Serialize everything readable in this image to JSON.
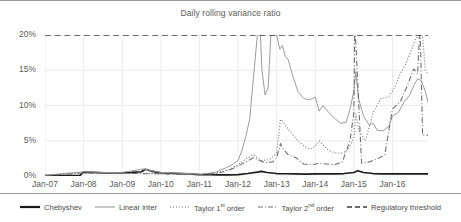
{
  "chart_data": {
    "type": "line",
    "title": "Daily rolling variance ratio",
    "xlabel": "",
    "ylabel": "",
    "xlim": [
      2007.0,
      2016.92
    ],
    "ylim": [
      0,
      20
    ],
    "grid": true,
    "y_unit": "%",
    "legend_position": "bottom",
    "x_tick_labels": [
      "Jan-07",
      "Jan-08",
      "Jan-09",
      "Jan-10",
      "Jan-11",
      "Jan-12",
      "Jan-13",
      "Jan-14",
      "Jan-15",
      "Jan-16"
    ],
    "x_tick_values": [
      2007,
      2008,
      2009,
      2010,
      2011,
      2012,
      2013,
      2014,
      2015,
      2016
    ],
    "y_tick_labels": [
      "0%",
      "5%",
      "10%",
      "15%",
      "20%"
    ],
    "y_tick_values": [
      0,
      5,
      10,
      15,
      20
    ],
    "series": [
      {
        "name": "Chebyshev",
        "style": "solid",
        "color": "#1a1a1a",
        "width": 1.7,
        "x": [
          2007.0,
          2007.3,
          2007.6,
          2007.9,
          2008.0,
          2008.25,
          2008.5,
          2008.75,
          2009.0,
          2009.25,
          2009.5,
          2009.6,
          2009.75,
          2010.0,
          2010.25,
          2010.5,
          2010.75,
          2011.0,
          2011.25,
          2011.5,
          2011.75,
          2012.0,
          2012.25,
          2012.5,
          2012.6,
          2012.75,
          2013.0,
          2013.25,
          2013.5,
          2013.75,
          2014.0,
          2014.25,
          2014.5,
          2014.75,
          2015.0,
          2015.1,
          2015.25,
          2015.5,
          2015.75,
          2016.0,
          2016.25,
          2016.5,
          2016.75,
          2016.92
        ],
        "y": [
          0.05,
          0.05,
          0.05,
          0.05,
          0.55,
          0.5,
          0.45,
          0.45,
          0.45,
          0.5,
          0.6,
          0.95,
          0.7,
          0.45,
          0.4,
          0.35,
          0.3,
          0.2,
          0.18,
          0.15,
          0.15,
          0.2,
          0.35,
          0.55,
          0.65,
          0.5,
          0.35,
          0.32,
          0.3,
          0.28,
          0.3,
          0.3,
          0.3,
          0.35,
          0.5,
          0.75,
          0.5,
          0.35,
          0.3,
          0.3,
          0.3,
          0.3,
          0.3,
          0.3
        ]
      },
      {
        "name": "Linear inter",
        "style": "solid",
        "color": "#9b9b9b",
        "width": 1.0,
        "x": [
          2007.0,
          2008.0,
          2008.5,
          2009.0,
          2009.55,
          2010.0,
          2010.5,
          2011.0,
          2011.4,
          2011.7,
          2011.85,
          2012.0,
          2012.1,
          2012.2,
          2012.3,
          2012.4,
          2012.5,
          2012.58,
          2012.62,
          2012.7,
          2012.78,
          2012.85,
          2012.9,
          2013.0,
          2013.08,
          2013.15,
          2013.22,
          2013.3,
          2013.4,
          2013.55,
          2013.7,
          2013.85,
          2014.0,
          2014.1,
          2014.2,
          2014.35,
          2014.5,
          2014.65,
          2014.8,
          2014.9,
          2015.0,
          2015.05,
          2015.12,
          2015.25,
          2015.4,
          2015.5,
          2015.6,
          2015.75,
          2015.9,
          2016.0,
          2016.15,
          2016.3,
          2016.45,
          2016.55,
          2016.65,
          2016.75,
          2016.85,
          2016.92
        ],
        "y": [
          0.1,
          0.6,
          0.5,
          0.5,
          1.0,
          0.5,
          0.4,
          0.25,
          0.5,
          1.2,
          1.6,
          2.2,
          3.6,
          5.6,
          8.0,
          14.0,
          20.0,
          20.0,
          15.0,
          11.5,
          12.5,
          20.0,
          20.0,
          20.0,
          18.0,
          18.5,
          17.0,
          16.5,
          14.5,
          12.0,
          11.0,
          10.8,
          11.2,
          9.2,
          10.0,
          9.0,
          8.2,
          7.5,
          7.6,
          9.5,
          12.0,
          14.8,
          11.0,
          8.5,
          7.2,
          7.5,
          6.5,
          6.4,
          7.0,
          8.5,
          9.0,
          10.5,
          11.5,
          12.8,
          13.8,
          13.5,
          12.0,
          10.5
        ]
      },
      {
        "name": "Taylor 1st order",
        "style": "dotted",
        "color": "#6e6e6e",
        "width": 1.1,
        "x": [
          2007.0,
          2008.0,
          2009.0,
          2010.0,
          2011.0,
          2011.5,
          2011.8,
          2012.0,
          2012.2,
          2012.4,
          2012.5,
          2012.6,
          2012.8,
          2013.0,
          2013.1,
          2013.15,
          2013.25,
          2013.4,
          2013.55,
          2013.7,
          2013.85,
          2014.0,
          2014.1,
          2014.2,
          2014.35,
          2014.5,
          2014.65,
          2014.8,
          2014.9,
          2015.0,
          2015.05,
          2015.12,
          2015.3,
          2015.5,
          2015.7,
          2015.9,
          2016.05,
          2016.2,
          2016.35,
          2016.5,
          2016.6,
          2016.7,
          2016.78,
          2016.85,
          2016.92
        ],
        "y": [
          0.08,
          0.45,
          0.4,
          0.35,
          0.2,
          0.5,
          1.0,
          1.6,
          2.4,
          3.0,
          2.6,
          2.2,
          2.3,
          3.2,
          8.0,
          7.8,
          7.0,
          6.0,
          5.0,
          4.3,
          3.8,
          4.2,
          5.0,
          4.4,
          3.6,
          3.3,
          3.2,
          3.5,
          4.2,
          5.5,
          8.8,
          6.5,
          5.0,
          9.0,
          11.0,
          11.2,
          12.5,
          14.5,
          16.0,
          18.0,
          19.5,
          20.0,
          20.0,
          15.0,
          14.5
        ]
      },
      {
        "name": "Taylor 2nd order",
        "style": "dashdot",
        "color": "#707070",
        "width": 1.1,
        "x": [
          2007.0,
          2008.0,
          2009.0,
          2010.0,
          2011.0,
          2011.5,
          2011.8,
          2012.0,
          2012.2,
          2012.4,
          2012.55,
          2012.7,
          2012.9,
          2013.0,
          2013.1,
          2013.15,
          2013.3,
          2013.5,
          2013.7,
          2013.9,
          2014.1,
          2014.3,
          2014.5,
          2014.7,
          2014.9,
          2015.0,
          2015.02,
          2015.04,
          2015.2,
          2015.4,
          2015.6,
          2015.8,
          2016.0,
          2016.2,
          2016.4,
          2016.55,
          2016.65,
          2016.7,
          2016.72,
          2016.78,
          2016.92
        ],
        "y": [
          0.06,
          0.4,
          0.38,
          0.3,
          0.18,
          0.4,
          0.9,
          1.4,
          2.0,
          2.6,
          2.2,
          1.9,
          2.0,
          2.6,
          4.6,
          4.0,
          3.0,
          2.6,
          1.7,
          1.6,
          1.8,
          1.7,
          1.6,
          2.0,
          5.0,
          9.0,
          20.0,
          20.0,
          1.8,
          2.0,
          2.4,
          3.0,
          9.5,
          10.5,
          13.0,
          15.2,
          14.5,
          20.0,
          20.0,
          5.8,
          5.8
        ]
      },
      {
        "name": "Regulatory threshold",
        "style": "dashed",
        "color": "#3c3c3c",
        "width": 1.3,
        "x": [
          2007.0,
          2016.92
        ],
        "y": [
          20,
          20
        ]
      }
    ]
  },
  "legend": {
    "items": [
      {
        "label_prefix": "Chebyshev",
        "sup": "",
        "label_suffix": "",
        "style": "solid-thick"
      },
      {
        "label_prefix": "Linear inter",
        "sup": "",
        "label_suffix": "",
        "style": "solid-thin"
      },
      {
        "label_prefix": "Taylor 1",
        "sup": "st",
        "label_suffix": " order",
        "style": "dotted"
      },
      {
        "label_prefix": "Taylor 2",
        "sup": "nd",
        "label_suffix": " order",
        "style": "dashdot"
      },
      {
        "label_prefix": "Regulatory threshold",
        "sup": "",
        "label_suffix": "",
        "style": "dashed"
      }
    ]
  },
  "colors": {
    "chebyshev": "#1a1a1a",
    "linear_inter": "#9b9b9b",
    "taylor_1st": "#6e6e6e",
    "taylor_2nd": "#707070",
    "regulatory_threshold": "#3c3c3c",
    "grid": "#ececec",
    "text": "#5a5a5a"
  }
}
